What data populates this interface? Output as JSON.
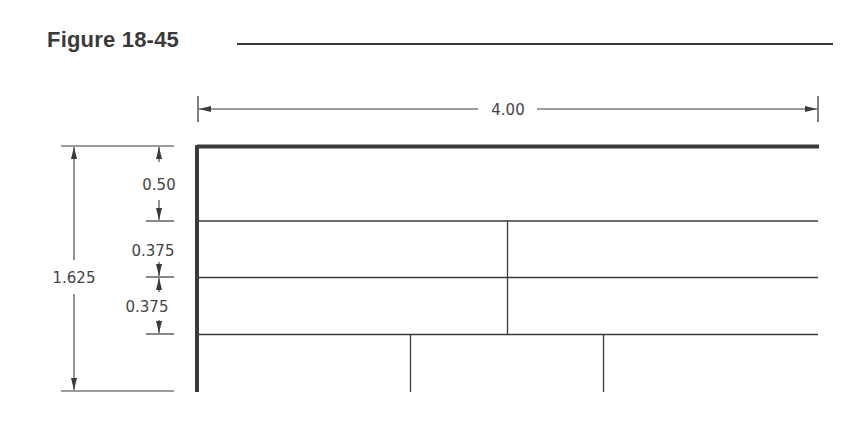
{
  "figure": {
    "title": "Figure 18-45"
  },
  "dimensions": {
    "overall_width": "4.00",
    "overall_height": "1.625",
    "top_band_height": "0.50",
    "middle_band_1_height": "0.375",
    "middle_band_2_height": "0.375"
  },
  "colors": {
    "line": "#3a3a3a",
    "text": "#444444",
    "background": "#ffffff"
  }
}
